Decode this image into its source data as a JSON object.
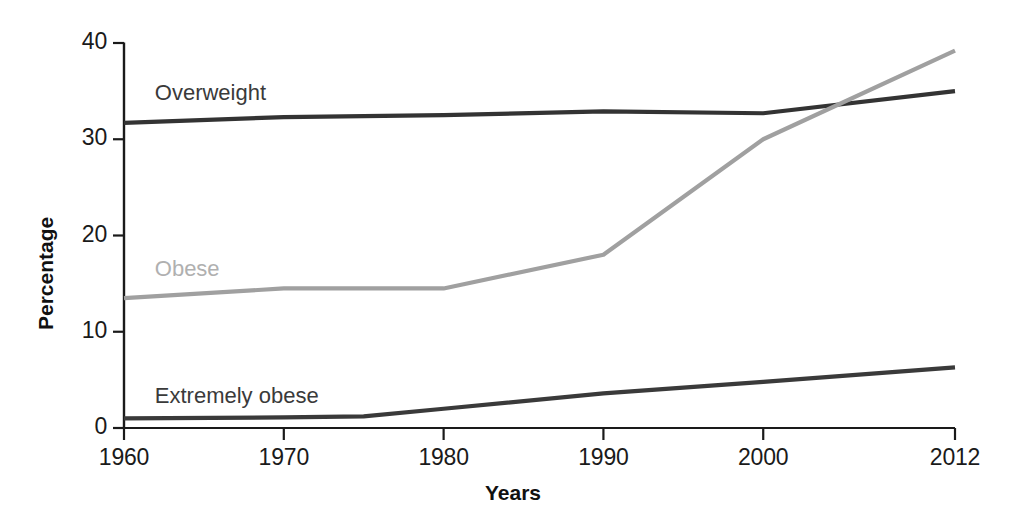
{
  "chart_data": {
    "type": "line",
    "title": "",
    "xlabel": "Years",
    "ylabel": "Percentage",
    "xlim": [
      1960,
      2012
    ],
    "ylim": [
      0,
      40
    ],
    "grid": false,
    "legend_position": "inline-labels",
    "x_ticks": [
      "1960",
      "1970",
      "1980",
      "1990",
      "2000",
      "2012"
    ],
    "x_tick_values": [
      1960,
      1970,
      1980,
      1990,
      2000,
      2012
    ],
    "y_ticks": [
      "0",
      "10",
      "20",
      "30",
      "40"
    ],
    "y_tick_values": [
      0,
      10,
      20,
      30,
      40
    ],
    "series": [
      {
        "name": "Overweight",
        "color": "#333333",
        "label_color": "#3a3a3a",
        "x": [
          1960,
          1970,
          1980,
          1990,
          2000,
          2012
        ],
        "values": [
          31.7,
          32.3,
          32.5,
          32.9,
          32.7,
          35.0
        ]
      },
      {
        "name": "Obese",
        "color": "#a0a0a0",
        "label_color": "#b0b0b0",
        "x": [
          1960,
          1970,
          1980,
          1990,
          2000,
          2012
        ],
        "values": [
          13.5,
          14.5,
          14.5,
          18.0,
          30.0,
          39.2
        ]
      },
      {
        "name": "Extremely obese",
        "color": "#3a3a3a",
        "label_color": "#3a3a3a",
        "x": [
          1960,
          1970,
          1975,
          1980,
          1990,
          2000,
          2012
        ],
        "values": [
          1.0,
          1.1,
          1.2,
          2.0,
          3.6,
          4.8,
          6.3
        ]
      }
    ],
    "series_labels": [
      {
        "text": "Overweight",
        "x": 1960.8,
        "y": 34.6,
        "color": "#3a3a3a"
      },
      {
        "text": "Obese",
        "x": 1960.8,
        "y": 16.3,
        "color": "#b0b0b0"
      },
      {
        "text": "Extremely obese",
        "x": 1960.8,
        "y": 3.1,
        "color": "#3a3a3a"
      }
    ],
    "axis_color": "#1a1a1a"
  }
}
